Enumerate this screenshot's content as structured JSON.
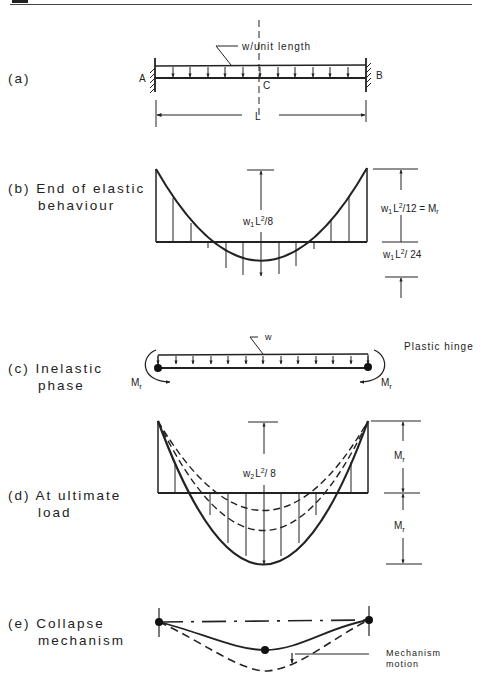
{
  "figure": {
    "panels": [
      {
        "id": "a",
        "label_line1": "(a)",
        "label_line2": ""
      },
      {
        "id": "b",
        "label_line1": "(b) End of elastic",
        "label_line2": "behaviour"
      },
      {
        "id": "c",
        "label_line1": "(c) Inelastic",
        "label_line2": "phase"
      },
      {
        "id": "d",
        "label_line1": "(d) At ultimate",
        "label_line2": "load"
      },
      {
        "id": "e",
        "label_line1": "(e) Collapse",
        "label_line2": "mechanism"
      }
    ],
    "a": {
      "load_label": "w/unit length",
      "support_left": "A",
      "support_right": "B",
      "midpoint": "C",
      "span": "L"
    },
    "b": {
      "midspan_moment": "w1L²/8",
      "midspan_moment_base": "w",
      "midspan_moment_sub": "1",
      "midspan_moment_rest": "L",
      "midspan_moment_sup": "2",
      "midspan_moment_tail": "/8",
      "end_moment_tail": "/12 = M",
      "end_moment_sub2": "r",
      "mid_moment_tail": "/ 24"
    },
    "c": {
      "load_label": "w",
      "hinge_label": "Plastic hinge",
      "moment_left": "M",
      "moment_right": "M",
      "moment_sub": "r"
    },
    "d": {
      "midspan_moment_base": "w",
      "midspan_moment_sub": "2",
      "midspan_moment_rest": "L",
      "midspan_moment_sup": "2",
      "midspan_moment_tail": "/ 8",
      "upper_moment": "M",
      "lower_moment": "M",
      "moment_sub": "r"
    },
    "e": {
      "motion_label_line1": "Mechanism",
      "motion_label_line2": "motion"
    }
  }
}
